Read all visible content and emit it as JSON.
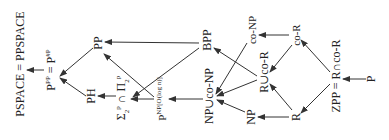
{
  "diagram": {
    "orientation": "rotated -90deg",
    "nodes": {
      "pspace": {
        "label": "PSPACE = PPSPACE",
        "x": 20,
        "y": 64
      },
      "ppp": {
        "label": "P",
        "sup": "PP",
        "eq": " = P",
        "sup2": "#P",
        "x": 51,
        "y": 70
      },
      "pp": {
        "label": "PP",
        "x": 98,
        "y": 43
      },
      "ph": {
        "label": "PH",
        "x": 91,
        "y": 96
      },
      "sigma": {
        "label": "Σ",
        "sub1": "2",
        "sup1": "p",
        "cap": " ∩ Π",
        "sub2": "2",
        "sup2": "p",
        "x": 123,
        "y": 94
      },
      "pnplog": {
        "label": "P",
        "sup": "NP[O(log n)]",
        "x": 162,
        "y": 95
      },
      "bpp": {
        "label": "BPP",
        "x": 207,
        "y": 37
      },
      "npuconp": {
        "label": "NP∪co-NP",
        "x": 209,
        "y": 90
      },
      "conp": {
        "label": "co-NP",
        "x": 251,
        "y": 29
      },
      "ruecor": {
        "label": "R∪co-R",
        "x": 264,
        "y": 71
      },
      "np": {
        "label": "NP",
        "x": 251,
        "y": 117
      },
      "cor": {
        "label": "co-R",
        "x": 296,
        "y": 35
      },
      "r": {
        "label": "R",
        "x": 296,
        "y": 117
      },
      "zpp": {
        "label": "ZPP = R∩co-R",
        "x": 335,
        "y": 73
      },
      "p": {
        "label": "P",
        "x": 371,
        "y": 79
      }
    },
    "edges": [
      {
        "from": "ppp",
        "to": "pspace"
      },
      {
        "from": "pp",
        "to": "ppp"
      },
      {
        "from": "ph",
        "to": "ppp"
      },
      {
        "from": "bpp",
        "to": "pp"
      },
      {
        "from": "pnplog",
        "to": "pp"
      },
      {
        "from": "sigma",
        "to": "ph"
      },
      {
        "from": "bpp",
        "to": "sigma"
      },
      {
        "from": "pnplog",
        "to": "sigma"
      },
      {
        "from": "npuconp",
        "to": "pnplog"
      },
      {
        "from": "conp",
        "to": "npuconp"
      },
      {
        "from": "np",
        "to": "npuconp"
      },
      {
        "from": "ruecor",
        "to": "npuconp"
      },
      {
        "from": "ruecor",
        "to": "bpp"
      },
      {
        "from": "cor",
        "to": "conp"
      },
      {
        "from": "r",
        "to": "np"
      },
      {
        "from": "cor",
        "to": "ruecor"
      },
      {
        "from": "r",
        "to": "ruecor"
      },
      {
        "from": "zpp",
        "to": "cor"
      },
      {
        "from": "zpp",
        "to": "r"
      },
      {
        "from": "p",
        "to": "zpp"
      }
    ],
    "colors": {
      "line": "#333333",
      "text": "#222222",
      "background": "#ffffff"
    }
  }
}
